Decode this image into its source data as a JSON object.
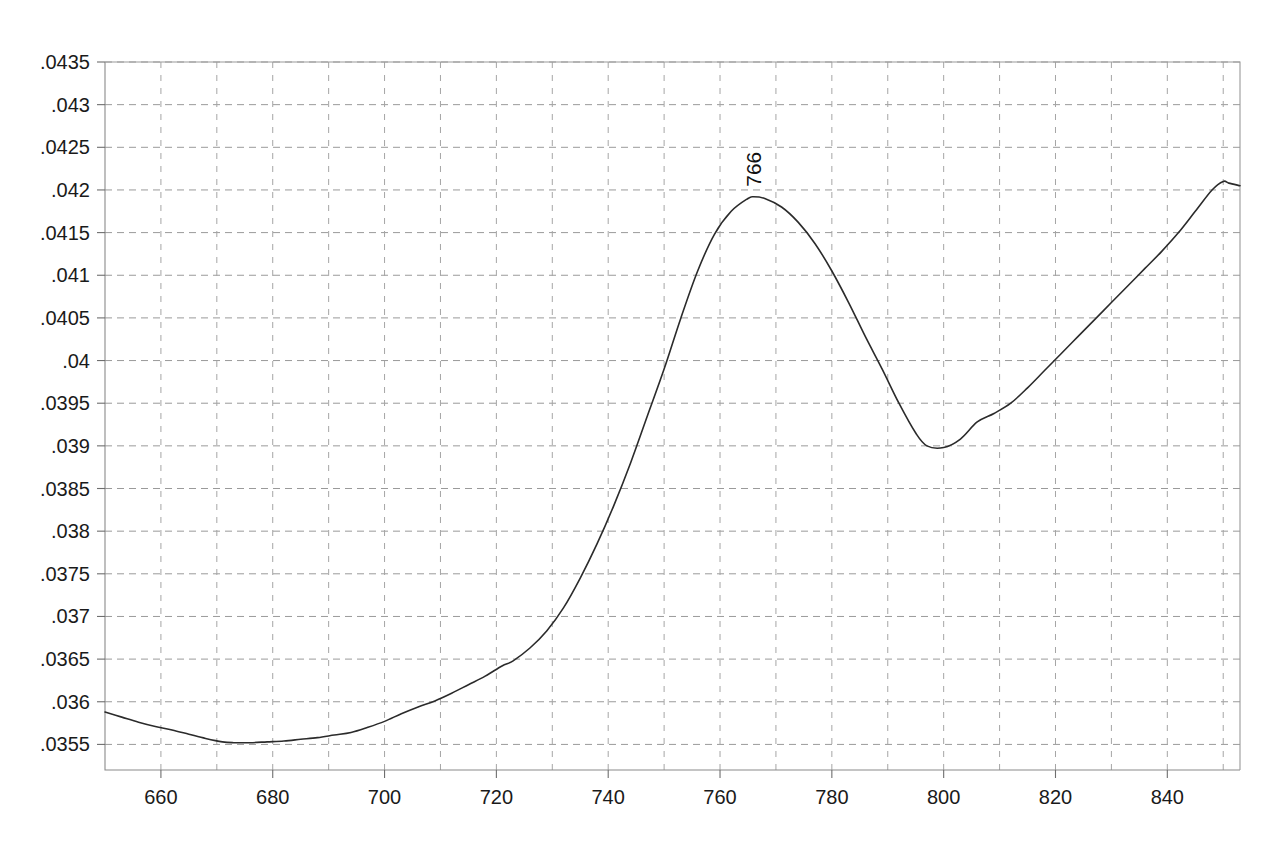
{
  "chart_data": {
    "type": "line",
    "title": "",
    "subtitle": "",
    "xlabel": "",
    "ylabel": "",
    "xlim": [
      650,
      853
    ],
    "ylim": [
      0.0352,
      0.0435
    ],
    "grid": true,
    "legend": false,
    "legend_position": "none",
    "background_color": "#ffffff",
    "curve_color": "#2b2b2b",
    "grid_color": "#9a9a9a",
    "y_tick_labels": [
      ".0435",
      ".043",
      ".0425",
      ".042",
      ".0415",
      ".041",
      ".0405",
      ".04",
      ".0395",
      ".039",
      ".0385",
      ".038",
      ".0375",
      ".037",
      ".0365",
      ".036",
      ".0355"
    ],
    "y_tick_values": [
      0.0435,
      0.043,
      0.0425,
      0.042,
      0.0415,
      0.041,
      0.0405,
      0.04,
      0.0395,
      0.039,
      0.0385,
      0.038,
      0.0375,
      0.037,
      0.0365,
      0.036,
      0.0355
    ],
    "x_tick_labels": [
      "660",
      "680",
      "700",
      "720",
      "740",
      "760",
      "780",
      "800",
      "820",
      "840"
    ],
    "x_tick_values": [
      660,
      680,
      700,
      720,
      740,
      760,
      780,
      800,
      820,
      840
    ],
    "x_minor_gridlines": [
      660,
      670,
      680,
      690,
      700,
      710,
      720,
      730,
      740,
      750,
      760,
      770,
      780,
      790,
      800,
      810,
      820,
      830,
      840,
      850
    ],
    "annotations": [
      {
        "label": "766",
        "x": 766,
        "y": 0.04192,
        "rotation": -90
      }
    ],
    "series": [
      {
        "name": "spectrum",
        "x": [
          650,
          653,
          656,
          659,
          662,
          665,
          668,
          671,
          673,
          676,
          679,
          682,
          685,
          688,
          691,
          694,
          697,
          700,
          703,
          706,
          709,
          712,
          715,
          718,
          721,
          723,
          726,
          729,
          732,
          735,
          738,
          741,
          744,
          747,
          750,
          753,
          756,
          759,
          762,
          765,
          766,
          768,
          771,
          774,
          777,
          780,
          783,
          786,
          789,
          792,
          795,
          797,
          800,
          803,
          806,
          809,
          812,
          815,
          818,
          821,
          824,
          827,
          830,
          833,
          836,
          839,
          842,
          845,
          848,
          850,
          851,
          853
        ],
        "y": [
          0.03588,
          0.03582,
          0.03576,
          0.03571,
          0.03567,
          0.03562,
          0.03557,
          0.03553,
          0.03552,
          0.03552,
          0.03553,
          0.03554,
          0.03556,
          0.03558,
          0.03561,
          0.03564,
          0.0357,
          0.03577,
          0.03586,
          0.03594,
          0.03601,
          0.0361,
          0.0362,
          0.0363,
          0.03642,
          0.03648,
          0.03663,
          0.03683,
          0.0371,
          0.03745,
          0.03785,
          0.0383,
          0.0388,
          0.03935,
          0.0399,
          0.0405,
          0.04105,
          0.04148,
          0.04175,
          0.0419,
          0.04192,
          0.0419,
          0.0418,
          0.04162,
          0.04137,
          0.04105,
          0.04068,
          0.04028,
          0.0399,
          0.0395,
          0.03915,
          0.039,
          0.03898,
          0.03908,
          0.03928,
          0.03938,
          0.0395,
          0.03968,
          0.03988,
          0.04008,
          0.04028,
          0.04048,
          0.04068,
          0.04088,
          0.04108,
          0.04128,
          0.0415,
          0.04175,
          0.042,
          0.0421,
          0.04208,
          0.04205
        ]
      }
    ]
  },
  "plot": {
    "frame_left_px": 105,
    "frame_right_px": 1240,
    "frame_top_px": 62,
    "frame_bottom_px": 770
  }
}
